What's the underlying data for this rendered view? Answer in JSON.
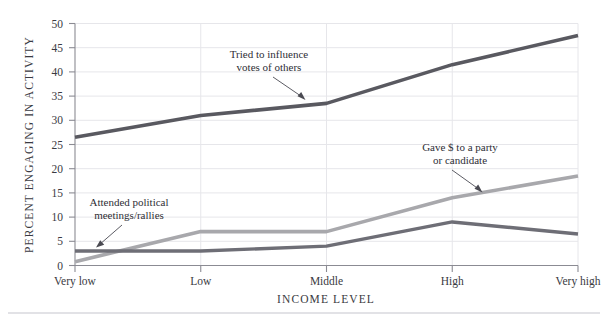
{
  "figure": {
    "background_color": "#ffffff",
    "bottom_rule_color": "#d9d9de"
  },
  "chart_data": {
    "type": "line",
    "title": "",
    "xlabel": "INCOME LEVEL",
    "ylabel": "PERCENT ENGAGING IN ACTIVITY",
    "categories": [
      "Very low",
      "Low",
      "Middle",
      "High",
      "Very high"
    ],
    "ylim": [
      0,
      50
    ],
    "yticks": [
      0,
      5,
      10,
      15,
      20,
      25,
      30,
      35,
      40,
      45,
      50
    ],
    "ytick_labels": [
      "0",
      "5",
      "10",
      "15",
      "20",
      "25",
      "30",
      "35",
      "40",
      "45",
      "50"
    ],
    "grid": "horizontal-and-vertical",
    "legend": "none-inline-annotations",
    "series": [
      {
        "name": "Tried to influence votes of others",
        "color": "#595960",
        "values": [
          26.5,
          31,
          33.5,
          41.5,
          47.5
        ]
      },
      {
        "name": "Gave $ to a party or candidate",
        "color": "#a8a8ac",
        "values": [
          0.8,
          7,
          7,
          14,
          18.5
        ]
      },
      {
        "name": "Attended political meetings/rallies",
        "color": "#6e6e76",
        "values": [
          3,
          3,
          4,
          9,
          6.5
        ]
      }
    ],
    "annotations": [
      {
        "id": "influence",
        "lines": [
          "Tried to influence",
          "votes of others"
        ],
        "target_category": "Middle",
        "target_value": 33.5
      },
      {
        "id": "gave-money",
        "lines": [
          "Gave $ to a party",
          "or candidate"
        ],
        "target_category": "High",
        "target_value": 14
      },
      {
        "id": "attended",
        "lines": [
          "Attended political",
          "meetings/rallies"
        ],
        "target_category": "Very low",
        "target_value": 3
      }
    ]
  }
}
